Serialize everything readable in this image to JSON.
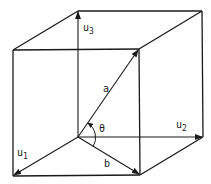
{
  "diagram": {
    "stroke_color": "#1a1a1a",
    "background": "#ffffff",
    "labels": {
      "u3": {
        "main": "u",
        "sub": "3"
      },
      "u2": {
        "main": "u",
        "sub": "2"
      },
      "u1": {
        "main": "u",
        "sub": "1"
      },
      "a": "a",
      "b": "b",
      "theta": "θ"
    },
    "vertices": {
      "origin": [
        78,
        137
      ],
      "back_top_left": [
        78,
        11
      ],
      "back_top_right": [
        202,
        11
      ],
      "back_bottom_right": [
        203,
        137
      ],
      "front_top_left": [
        13,
        50
      ],
      "front_top_right": [
        139,
        49
      ],
      "front_bottom_left": [
        13,
        176
      ],
      "front_bottom_right": [
        140,
        175
      ]
    },
    "vectors": [
      {
        "name": "u3",
        "from": "origin",
        "to": "back_top_left"
      },
      {
        "name": "u2",
        "from": "origin",
        "to": "back_bottom_right"
      },
      {
        "name": "u1",
        "from": "origin",
        "to": "front_bottom_left"
      },
      {
        "name": "a",
        "from": "origin",
        "to": "front_top_right"
      },
      {
        "name": "b",
        "from": "origin",
        "to": "front_bottom_right"
      }
    ]
  }
}
